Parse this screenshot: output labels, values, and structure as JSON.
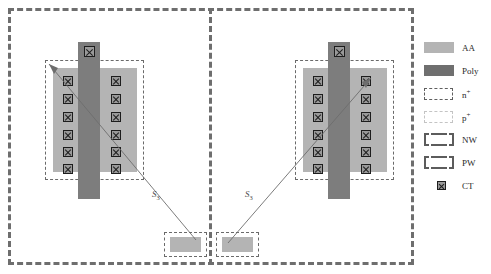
{
  "diagram": {
    "colors": {
      "aa": "#b4b4b4",
      "poly": "#7d7d7d",
      "ct_fill": "#9a9a9a",
      "ct_stroke": "#1d1d1d",
      "nplus_stroke": "#6a6a6a",
      "pplus_stroke": "#c8c8c8",
      "well_stroke": "#6e6e6e",
      "leader_stroke": "#6d6d6d",
      "background": "#ffffff"
    },
    "devices": [
      {
        "id": "left-device",
        "aa_label": "AA",
        "poly_label": "Poly",
        "contact_rows": 6,
        "contact_columns": 2,
        "gate_contact_count": 1,
        "source_label": "S",
        "source_label_subscript": "3"
      },
      {
        "id": "right-device",
        "aa_label": "AA",
        "poly_label": "Poly",
        "contact_rows": 6,
        "contact_columns": 2,
        "gate_contact_count": 1,
        "source_label": "S",
        "source_label_subscript": "3"
      }
    ],
    "source_pads": [
      {
        "id": "left-source-pad",
        "label": "AA"
      },
      {
        "id": "right-source-pad",
        "label": "AA"
      }
    ]
  },
  "legend": {
    "items": [
      {
        "key": "aa",
        "label": "AA",
        "label_sup": "",
        "swatch": "filled-light-gray-rect"
      },
      {
        "key": "poly",
        "label": "Poly",
        "label_sup": "",
        "swatch": "filled-dark-gray-rect"
      },
      {
        "key": "nplus",
        "label": "n",
        "label_sup": "+",
        "swatch": "dashed-dark-rect"
      },
      {
        "key": "pplus",
        "label": "p",
        "label_sup": "+",
        "swatch": "dashed-light-rect"
      },
      {
        "key": "nw",
        "label": "NW",
        "label_sup": "",
        "swatch": "bracket-rect"
      },
      {
        "key": "pw",
        "label": "PW",
        "label_sup": "",
        "swatch": "bracket-rect"
      },
      {
        "key": "ct",
        "label": "CT",
        "label_sup": "",
        "swatch": "crossed-square"
      }
    ]
  }
}
